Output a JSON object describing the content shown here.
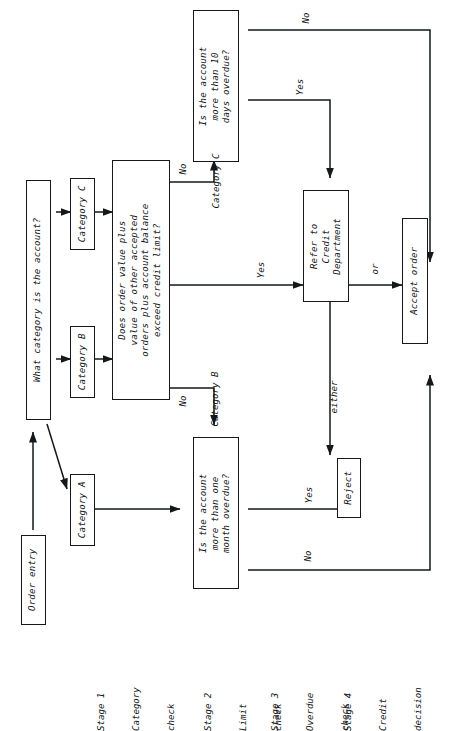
{
  "diagram": {
    "orientation": "rotated-90-ccw",
    "line_color": "#15181a",
    "background": "#ffffff"
  },
  "nodes": {
    "order_entry": "Order entry",
    "what_category": "What category is the account?",
    "category_a": "Category A",
    "category_b": "Category B",
    "category_c": "Category C",
    "limit_check": "Does order value plus\nvalue of other accepted\norders plus account balance\nexceed credit limit?",
    "overdue_month": "Is the account\nmore than one\nmonth overdue?",
    "overdue_days": "Is the account\nmore than 10\ndays overdue?",
    "refer_credit": "Refer to\nCredit\nDepartment",
    "reject": "Reject",
    "accept_order": "Accept order"
  },
  "edge_labels": {
    "category_b": "Category B",
    "category_c": "Category C",
    "limit_no_b": "No",
    "limit_no_c": "No",
    "limit_yes": "Yes",
    "days_no": "No",
    "days_yes": "Yes",
    "month_yes": "Yes",
    "month_no": "No",
    "either": "either",
    "or": "or"
  },
  "stages": [
    {
      "line1": "Stage 1",
      "line2": "Category",
      "line3": "check"
    },
    {
      "line1": "Stage 2",
      "line2": "Limit",
      "line3": "check"
    },
    {
      "line1": "Stage 3",
      "line2": "Overdue",
      "line3": "check"
    },
    {
      "line1": "Stage 4",
      "line2": "Credit",
      "line3": "decision"
    }
  ]
}
